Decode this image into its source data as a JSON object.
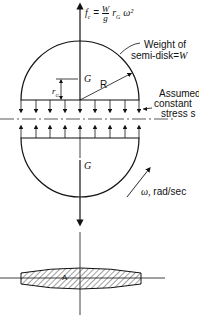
{
  "formula": {
    "lhs": "f",
    "lhs_sub": "c",
    "eq": "=",
    "num": "W",
    "den": "g",
    "den_sub": "c",
    "rhs": "r",
    "rhs_sub": "G",
    "rhs_tail": "ω²"
  },
  "labels": {
    "weight_line1": "Weight of",
    "weight_line2": "semi-disk=",
    "weight_var": "W",
    "centroid_top": "G",
    "centroid_bottom": "G",
    "rg": "r",
    "rg_sub": "G",
    "radius": "R",
    "stress_line1": "Assumed",
    "stress_line2": "constant",
    "stress_line3": "stress s",
    "omega": "ω,",
    "omega_unit": "rad/sec",
    "area": "A"
  },
  "colors": {
    "ink": "#111111",
    "background": "#ffffff"
  }
}
